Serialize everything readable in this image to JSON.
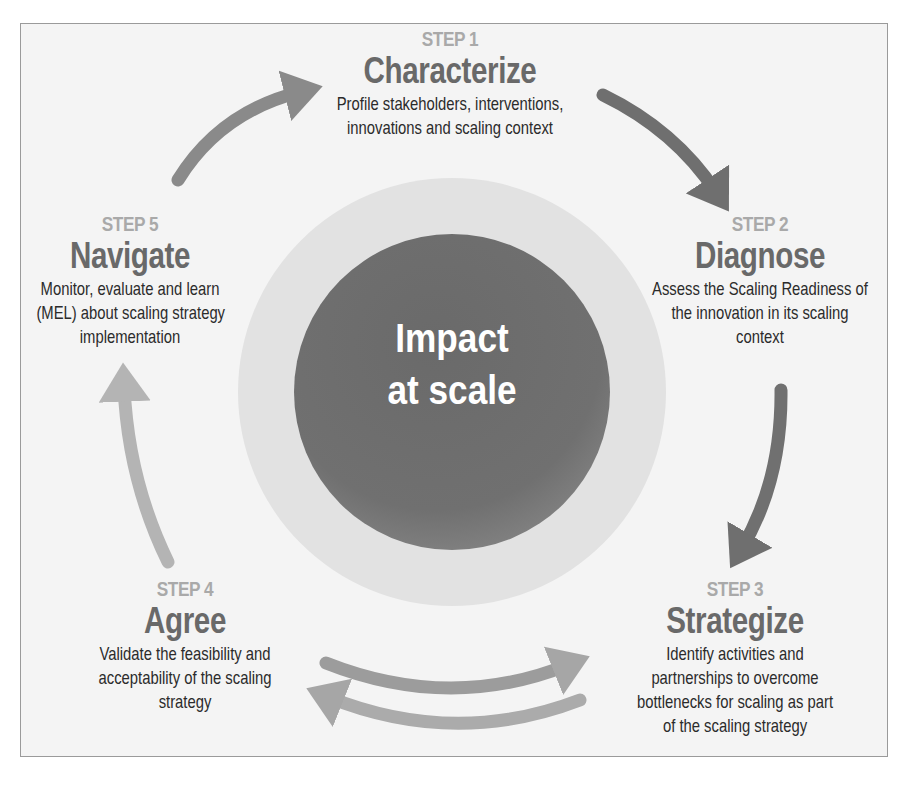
{
  "center": {
    "line1": "Impact",
    "line2": "at scale"
  },
  "steps": [
    {
      "label": "STEP 1",
      "title": "Characterize",
      "description": [
        "Profile stakeholders, interventions,",
        "innovations and scaling context"
      ]
    },
    {
      "label": "STEP 2",
      "title": "Diagnose",
      "description": [
        "Assess the Scaling Readiness of",
        "the innovation in its scaling",
        "context"
      ]
    },
    {
      "label": "STEP 3",
      "title": "Strategize",
      "description": [
        "Identify activities and",
        "partnerships to overcome",
        "bottlenecks for scaling as part",
        "of the scaling strategy"
      ]
    },
    {
      "label": "STEP 4",
      "title": "Agree",
      "description": [
        "Validate the feasibility and",
        "acceptability of the scaling",
        "strategy"
      ]
    },
    {
      "label": "STEP 5",
      "title": "Navigate",
      "description": [
        "Monitor, evaluate and learn",
        "(MEL) about scaling strategy",
        "implementation"
      ]
    }
  ],
  "colors": {
    "background": "#f4f4f4",
    "border": "#9a9a9a",
    "step_label": "#a9a9a9",
    "step_title": "#696969",
    "description": "#2b2b2b",
    "core_circle": "#6e6e6e",
    "halo_circle": "#e2e2e2",
    "arrow_dark": "#6f6f6f",
    "arrow_mid": "#8a8a8a",
    "arrow_light": "#b4b4b4"
  }
}
